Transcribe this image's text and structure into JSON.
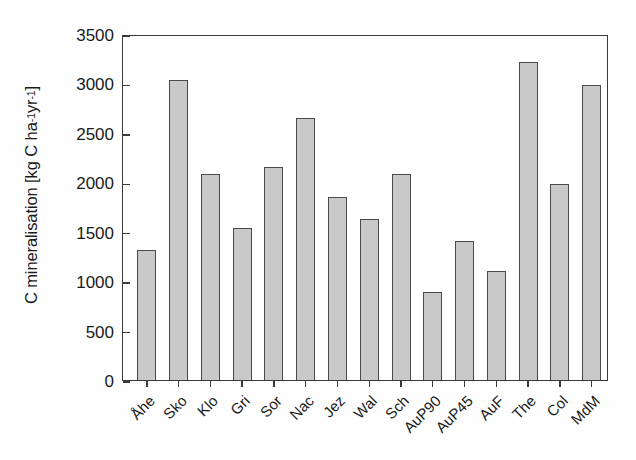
{
  "chart_data": {
    "type": "bar",
    "title": "",
    "xlabel": "",
    "ylabel": "C mineralisation [kg C ha⁻¹ yr⁻¹]",
    "ylabel_parts": {
      "prefix": "C mineralisation [kg C ha",
      "sup1": "-1",
      "mid": " yr",
      "sup2": "-1",
      "suffix": "]"
    },
    "categories": [
      "Åhe",
      "Sko",
      "Klo",
      "Gri",
      "Sor",
      "Nac",
      "Jez",
      "Wal",
      "Sch",
      "AuP90",
      "AuP45",
      "AuF",
      "The",
      "Col",
      "MdM"
    ],
    "values": [
      1320,
      3030,
      2085,
      1540,
      2155,
      2650,
      1850,
      1630,
      2080,
      890,
      1405,
      1100,
      3220,
      1985,
      2985
    ],
    "ylim": [
      0,
      3500
    ],
    "yticks": [
      0,
      500,
      1000,
      1500,
      2000,
      2500,
      3000,
      3500
    ],
    "ytick_labels": [
      "0",
      "500",
      "1000",
      "1500",
      "2000",
      "2500",
      "3000",
      "3500"
    ],
    "grid": false,
    "legend": null,
    "bar_fill_color": "#c9c9c9",
    "bar_edge_color": "#4a4a4a",
    "axis_color": "#3a3a3a"
  }
}
